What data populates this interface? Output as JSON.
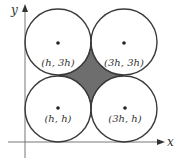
{
  "diagram": {
    "axes": {
      "x_label": "x",
      "y_label": "y"
    },
    "circles": [
      {
        "center_label": "(h, 3h)",
        "cx": 58,
        "cy": 42
      },
      {
        "center_label": "(3h, 3h)",
        "cx": 124,
        "cy": 42
      },
      {
        "center_label": "(h, h)",
        "cx": 58,
        "cy": 109
      },
      {
        "center_label": "(3h, h)",
        "cx": 124,
        "cy": 109
      }
    ],
    "radius": 33,
    "colors": {
      "stroke": "#3a3a3a",
      "shaded": "#6e6e6e",
      "axis": "#555555"
    }
  }
}
